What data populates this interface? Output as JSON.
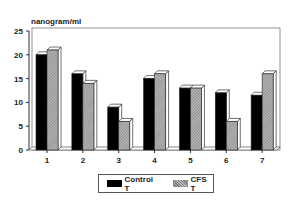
{
  "chart_data": {
    "type": "bar",
    "title": "",
    "ylabel": "nanogram/ml",
    "xlabel": "",
    "ylim": [
      0,
      25
    ],
    "yticks": [
      0,
      5,
      10,
      15,
      20,
      25
    ],
    "categories": [
      "1",
      "2",
      "3",
      "4",
      "5",
      "6",
      "7"
    ],
    "series": [
      {
        "name": "Control T",
        "color": "#000000",
        "values": [
          20,
          16,
          9,
          15,
          13,
          12,
          11.5
        ]
      },
      {
        "name": "CFS T",
        "color": "#999999",
        "pattern": "diagonal-hatch",
        "values": [
          21,
          14,
          6,
          16,
          13,
          6,
          16
        ]
      }
    ],
    "grid": false,
    "legend_position": "bottom-center",
    "style": "3d-bars"
  },
  "legend": {
    "control_label": "Control T",
    "cfs_label": "CFS T"
  }
}
